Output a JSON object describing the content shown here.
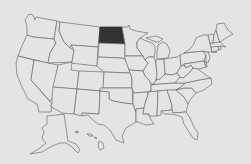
{
  "map": {
    "title": "United States map",
    "highlighted_state": "North Dakota",
    "colors": {
      "background": "#e4e4e4",
      "state_fill": "#e4e4e4",
      "state_border": "#6e6e6e",
      "highlight_fill": "#333333"
    },
    "states": [
      {
        "id": "WA",
        "name": "Washington",
        "highlighted": false,
        "d": "M29,14 L33,15 L35,20 L36,17 L57,21 L54,39 L33,37 L27,35 L27,26 L25,20 Z"
      },
      {
        "id": "OR",
        "name": "Oregon",
        "highlighted": false,
        "d": "M27,35 L33,37 L54,39 L56,43 L50,53 L48,63 L18,56 L22,46 Z"
      },
      {
        "id": "CA",
        "name": "California",
        "highlighted": false,
        "d": "M18,56 L34,60 L31,80 L52,104 L51,112 L39,112 L37,104 L28,99 L22,87 L17,75 L16,63 Z"
      },
      {
        "id": "NV",
        "name": "Nevada",
        "highlighted": false,
        "d": "M34,60 L58,65 L52,99 L50,101 L31,80 Z"
      },
      {
        "id": "ID",
        "name": "Idaho",
        "highlighted": false,
        "d": "M57,21 L60,22 L59,31 L64,42 L67,45 L70,48 L74,50 L72,62 L48,63 L50,53 L56,43 L54,39 Z"
      },
      {
        "id": "MT",
        "name": "Montana",
        "highlighted": false,
        "d": "M60,22 L100,27 L98,47 L71,45 L70,48 L67,45 L64,42 L59,31 Z"
      },
      {
        "id": "WY",
        "name": "Wyoming",
        "highlighted": false,
        "d": "M71,45 L98,47 L97,66 L70,63 L72,62 L74,50 Z"
      },
      {
        "id": "UT",
        "name": "Utah",
        "highlighted": false,
        "d": "M58,65 L72,62 L71,70 L79,71 L77,89 L53,87 Z"
      },
      {
        "id": "AZ",
        "name": "Arizona",
        "highlighted": false,
        "d": "M53,87 L77,89 L74,114 L62,113 L50,106 L52,104 L52,99 Z"
      },
      {
        "id": "CO",
        "name": "Colorado",
        "highlighted": false,
        "d": "M79,71 L104,72 L103,91 L77,89 Z"
      },
      {
        "id": "NM",
        "name": "New Mexico",
        "highlighted": false,
        "d": "M77,89 L100,91 L99,114 L82,113 L82,116 L74,114 Z"
      },
      {
        "id": "ND",
        "name": "North Dakota",
        "highlighted": true,
        "d": "M100,27 L122,27 L125,44 L99,43 Z"
      },
      {
        "id": "SD",
        "name": "South Dakota",
        "highlighted": false,
        "d": "M99,43 L125,44 L125,59 L121,58 L98,57 Z"
      },
      {
        "id": "NE",
        "name": "Nebraska",
        "highlighted": false,
        "d": "M98,57 L121,58 L125,59 L129,69 L130,73 L104,72 L97,66 Z"
      },
      {
        "id": "KS",
        "name": "Kansas",
        "highlighted": false,
        "d": "M104,72 L130,73 L132,78 L132,88 L103,88 Z"
      },
      {
        "id": "OK",
        "name": "Oklahoma",
        "highlighted": false,
        "d": "M100,88 L132,88 L133,104 L124,103 L113,101 L109,99 L109,92 L100,91 Z"
      },
      {
        "id": "TX",
        "name": "Texas",
        "highlighted": false,
        "d": "M109,92 L109,99 L113,101 L124,103 L133,104 L136,112 L136,122 L126,128 L122,136 L124,143 L116,140 L110,130 L104,125 L98,124 L93,120 L88,115 L82,116 L82,113 L99,114 L100,91 Z"
      },
      {
        "id": "MN",
        "name": "Minnesota",
        "highlighted": false,
        "d": "M122,27 L128,27 L129,25 L130,29 L136,31 L148,33 L140,38 L137,42 L137,48 L141,53 L143,56 L125,56 L125,44 Z"
      },
      {
        "id": "IA",
        "name": "Iowa",
        "highlighted": false,
        "d": "M125,56 L143,56 L145,60 L148,63 L145,68 L143,71 L129,70 L125,59 Z"
      },
      {
        "id": "MO",
        "name": "Missouri",
        "highlighted": false,
        "d": "M129,70 L143,71 L145,76 L149,80 L151,84 L151,91 L147,92 L134,93 L132,88 L132,78 L130,73 Z"
      },
      {
        "id": "AR",
        "name": "Arkansas",
        "highlighted": false,
        "d": "M133,93 L147,92 L148,95 L146,100 L144,108 L136,109 L136,112 L133,104 Z"
      },
      {
        "id": "LA",
        "name": "Louisiana",
        "highlighted": false,
        "d": "M136,109 L144,108 L143,114 L149,114 L150,118 L154,124 L146,125 L138,122 L136,122 L136,112 Z"
      },
      {
        "id": "WI",
        "name": "Wisconsin",
        "highlighted": false,
        "d": "M137,42 L140,38 L144,40 L152,43 L155,46 L155,52 L154,57 L148,57 L145,60 L143,56 L141,53 L137,48 Z"
      },
      {
        "id": "IL",
        "name": "Illinois",
        "highlighted": false,
        "d": "M148,57 L154,57 L156,64 L157,74 L156,80 L154,84 L151,84 L149,80 L145,76 L143,71 L145,68 L148,63 L145,60 Z"
      },
      {
        "id": "MI",
        "name": "Michigan",
        "highlighted": false,
        "d": "M146,38 L156,36 L163,39 L159,42 L156,42 Z M158,45 L163,42 L167,44 L170,51 L168,58 L157,59 L157,52 Z"
      },
      {
        "id": "IN",
        "name": "Indiana",
        "highlighted": false,
        "d": "M156,60 L164,59 L165,74 L160,79 L156,80 L157,74 L156,64 Z"
      },
      {
        "id": "OH",
        "name": "Ohio",
        "highlighted": false,
        "d": "M164,59 L170,58 L177,57 L180,55 L181,66 L177,73 L172,75 L165,74 Z"
      },
      {
        "id": "KY",
        "name": "Kentucky",
        "highlighted": false,
        "d": "M151,85 L154,84 L156,80 L160,79 L165,74 L172,75 L177,73 L180,77 L175,83 L160,84 Z"
      },
      {
        "id": "TN",
        "name": "Tennessee",
        "highlighted": false,
        "d": "M148,92 L151,91 L151,85 L160,84 L175,83 L185,83 L181,87 L176,90 L158,91 Z"
      },
      {
        "id": "MS",
        "name": "Mississippi",
        "highlighted": false,
        "d": "M146,100 L148,95 L148,92 L158,91 L157,116 L149,116 L149,114 L143,114 L144,108 Z"
      },
      {
        "id": "AL",
        "name": "Alabama",
        "highlighted": false,
        "d": "M158,91 L167,90 L172,105 L172,110 L161,111 L161,115 L157,116 Z"
      },
      {
        "id": "GA",
        "name": "Georgia",
        "highlighted": false,
        "d": "M167,90 L176,90 L184,97 L188,104 L186,112 L173,113 L172,110 L172,105 Z"
      },
      {
        "id": "FL",
        "name": "Florida",
        "highlighted": false,
        "d": "M161,111 L172,110 L173,113 L186,112 L190,118 L194,127 L198,133 L197,140 L193,138 L189,132 L184,124 L182,117 L176,115 L170,114 L164,114 Z"
      },
      {
        "id": "SC",
        "name": "South Carolina",
        "highlighted": false,
        "d": "M176,90 L184,88 L192,88 L196,93 L190,100 L188,104 L184,97 Z"
      },
      {
        "id": "NC",
        "name": "North Carolina",
        "highlighted": false,
        "d": "M181,87 L185,83 L199,80 L211,78 L212,84 L204,90 L196,93 L192,88 L184,88 L176,90 Z"
      },
      {
        "id": "VA",
        "name": "Virginia",
        "highlighted": false,
        "d": "M175,83 L180,77 L183,78 L189,73 L193,68 L198,69 L202,72 L207,76 L211,78 L199,80 L185,83 Z"
      },
      {
        "id": "WV",
        "name": "West Virginia",
        "highlighted": false,
        "d": "M177,73 L181,66 L184,65 L186,68 L191,65 L193,68 L189,73 L183,78 L180,77 Z"
      },
      {
        "id": "PA",
        "name": "Pennsylvania",
        "highlighted": false,
        "d": "M180,55 L184,53 L203,51 L206,55 L204,61 L184,64 L181,66 Z"
      },
      {
        "id": "MD",
        "name": "Maryland",
        "highlighted": false,
        "d": "M184,64 L204,61 L206,67 L203,68 L198,69 L193,68 L191,65 L186,68 Z"
      },
      {
        "id": "DE",
        "name": "Delaware",
        "highlighted": false,
        "d": "M204,61 L206,62 L207,67 L206,67 Z"
      },
      {
        "id": "NJ",
        "name": "New Jersey",
        "highlighted": false,
        "d": "M203,51 L208,52 L210,57 L208,63 L206,62 L206,55 Z"
      },
      {
        "id": "NY",
        "name": "New York",
        "highlighted": false,
        "d": "M184,53 L190,49 L194,44 L196,38 L203,35 L208,35 L211,47 L212,52 L217,52 L208,52 L203,51 Z"
      },
      {
        "id": "CT",
        "name": "Connecticut",
        "highlighted": false,
        "d": "M211,47 L218,46 L219,50 L212,52 Z"
      },
      {
        "id": "RI",
        "name": "Rhode Island",
        "highlighted": false,
        "d": "M218,46 L221,46 L221,49 L219,50 Z"
      },
      {
        "id": "MA",
        "name": "Massachusetts",
        "highlighted": false,
        "d": "M210,43 L220,42 L223,45 L226,47 L221,46 L211,47 Z"
      },
      {
        "id": "VT",
        "name": "Vermont",
        "highlighted": false,
        "d": "M208,35 L214,34 L213,43 L210,43 Z"
      },
      {
        "id": "NH",
        "name": "New Hampshire",
        "highlighted": false,
        "d": "M214,34 L216,30 L219,40 L220,42 L213,43 Z"
      },
      {
        "id": "ME",
        "name": "Maine",
        "highlighted": false,
        "d": "M216,30 L217,24 L224,23 L228,30 L233,34 L226,38 L220,42 L219,40 Z"
      },
      {
        "id": "AK",
        "name": "Alaska",
        "highlighted": false,
        "d": "M47,116 L64,114 L68,141 L76,144 L80,150 L78,153 L72,147 L66,143 L60,143 L52,146 L42,152 L30,154 L40,148 L46,143 L42,138 L44,132 L42,128 L47,124 Z"
      },
      {
        "id": "HI",
        "name": "Hawaii",
        "highlighted": false,
        "d": "M75,132 L78,131 L78,133 Z M87,134 L91,134 L93,136 L89,136 Z M94,137 L97,138 L96,139 Z M99,141 L103,143 L104,148 L100,150 L98,146 Z"
      }
    ]
  }
}
